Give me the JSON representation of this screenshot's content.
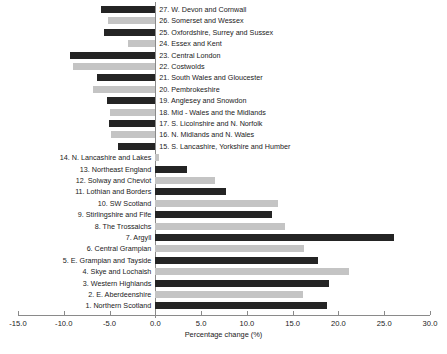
{
  "chart_data": {
    "type": "bar",
    "orientation": "horizontal",
    "title": "",
    "xlabel": "Percentage change (%)",
    "ylabel": "",
    "xlim": [
      -15.0,
      30.0
    ],
    "grid": false,
    "legend": "none",
    "xticks": [
      "-15.0",
      "-10.0",
      "-5.0",
      "0.0",
      "5.0",
      "10.0",
      "15.0",
      "20.0",
      "25.0",
      "30.0"
    ],
    "xtick_values": [
      -15,
      -10,
      -5,
      0,
      5,
      10,
      15,
      20,
      25,
      30
    ],
    "colors": {
      "dark": "#242424",
      "light": "#c4c4c4",
      "axis": "#8a8a8a"
    },
    "categories": [
      "1. Northern Scotland",
      "2. E. Aberdeenshire",
      "3. Western Highlands",
      "4. Skye and Lochaish",
      "5. E. Grampian and Tayside",
      "6. Central Grampian",
      "7. Argyll",
      "8. The Trossaichs",
      "9. Stirlingshire and Fife",
      "10. SW Scotland",
      "11. Lothian and Borders",
      "12. Solway and Cheviot",
      "13. Northeast England",
      "14. N. Lancashire and Lakes",
      "15. S. Lancashire, Yorkshire and Humber",
      "16. N. Midlands and N. Wales",
      "17. S. Licolnshire and N. Norfolk",
      "18. Mid - Wales and the Midlands",
      "19. Anglesey and Snowdon",
      "20. Pembrokeshire",
      "21. South Wales and Gloucester",
      "22. Costwolds",
      "23. Central London",
      "24. Essex and Kent",
      "25. Oxfordshire, Surrey and Sussex",
      "26. Somerset and Wessex",
      "27. W. Devon and Cornwall"
    ],
    "values": [
      18.7,
      16.1,
      19.0,
      21.1,
      17.8,
      16.2,
      26.1,
      14.2,
      12.7,
      13.4,
      7.7,
      6.5,
      3.5,
      0.4,
      -4.1,
      -4.8,
      -5.1,
      -4.9,
      -5.3,
      -6.8,
      -6.4,
      -9.0,
      -9.3,
      -3.0,
      -5.6,
      -5.2,
      -5.9
    ],
    "bar_shades": [
      "dark",
      "light",
      "dark",
      "light",
      "dark",
      "light",
      "dark",
      "light",
      "dark",
      "light",
      "dark",
      "light",
      "dark",
      "light",
      "dark",
      "light",
      "dark",
      "light",
      "dark",
      "light",
      "dark",
      "light",
      "dark",
      "light",
      "dark",
      "light",
      "dark"
    ]
  }
}
